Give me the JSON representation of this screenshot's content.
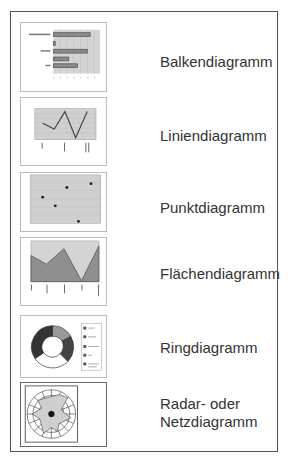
{
  "items": [
    {
      "label": "Balkendiagramm",
      "type": "bar"
    },
    {
      "label": "Liniendiagramm",
      "type": "line"
    },
    {
      "label": "Punktdiagramm",
      "type": "scatter"
    },
    {
      "label": "Flächendiagramm",
      "type": "area"
    },
    {
      "label": "Ringdiagramm",
      "type": "doughnut"
    },
    {
      "label": "Radar- oder\nNetzdiagramm",
      "type": "radar"
    }
  ],
  "colors": {
    "frame_border": "#555555",
    "thumb_border": "#bbbbbb",
    "plot_bg": "#d0d0d0",
    "series_dark": "#505050",
    "series_fill": "#8a8a8a",
    "text": "#333333"
  }
}
